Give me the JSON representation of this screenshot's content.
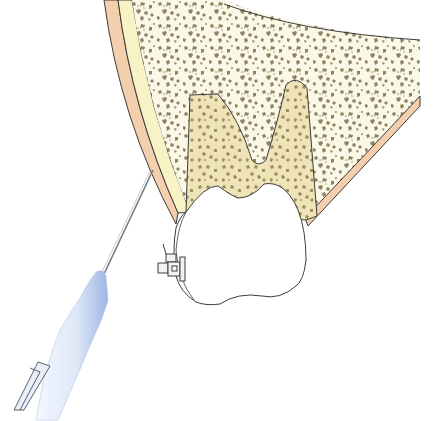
{
  "figure": {
    "type": "anatomical-illustration",
    "labels": [],
    "elements": {
      "soft_tissue": {
        "name": "gingiva-mucosa",
        "color": "#f4cfae"
      },
      "cortical_bone": {
        "name": "cortical-plate",
        "color": "#f7f3c4"
      },
      "cancellous_bone": {
        "name": "cancellous-bone",
        "color": "#fbf8e8",
        "speckle_color": "#8e8460"
      },
      "root_region": {
        "name": "tooth-root-region",
        "color": "#efe3b8"
      },
      "tooth_crown": {
        "name": "tooth-crown",
        "color": "#ffffff"
      },
      "bracket": {
        "name": "orthodontic-bracket",
        "color": "#f2f2f2"
      },
      "needle": {
        "name": "injection-needle",
        "color": "#9a9a9a"
      },
      "syringe": {
        "name": "syringe-hub",
        "color": "#dbe6f7",
        "shade": "#a9bfe8"
      }
    },
    "outline_color": "#3c3c3c"
  }
}
